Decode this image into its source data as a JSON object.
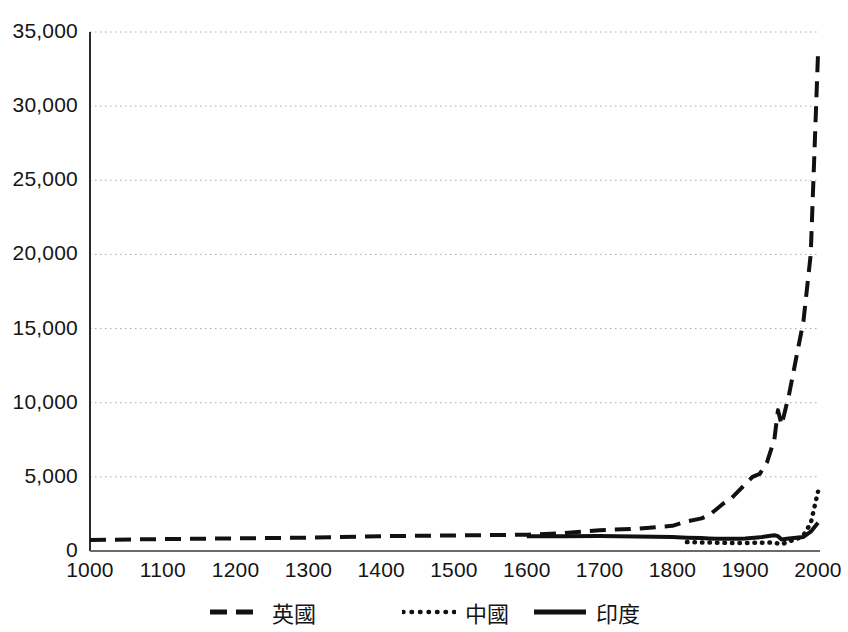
{
  "chart_data": {
    "type": "line",
    "title": "",
    "xlabel": "",
    "ylabel": "",
    "xlim": [
      1000,
      2000
    ],
    "ylim": [
      0,
      35000
    ],
    "grid": "horizontal-dotted",
    "legend_position": "bottom-center",
    "xticks": [
      "1000",
      "1100",
      "1200",
      "1300",
      "1400",
      "1500",
      "1600",
      "1700",
      "1800",
      "1900",
      "2000"
    ],
    "yticks": [
      "0",
      "5,000",
      "10,000",
      "15,000",
      "20,000",
      "25,000",
      "30,000",
      "35,000"
    ],
    "series": [
      {
        "name": "英國",
        "style": "dashed",
        "color": "#111111",
        "x": [
          1000,
          1100,
          1200,
          1300,
          1400,
          1500,
          1600,
          1650,
          1700,
          1750,
          1800,
          1820,
          1840,
          1850,
          1860,
          1870,
          1880,
          1890,
          1900,
          1910,
          1920,
          1930,
          1940,
          1945,
          1950,
          1960,
          1970,
          1980,
          1990,
          2000
        ],
        "values": [
          750,
          800,
          850,
          900,
          1000,
          1050,
          1100,
          1200,
          1400,
          1500,
          1700,
          2000,
          2200,
          2400,
          2800,
          3200,
          3500,
          4000,
          4500,
          5000,
          5200,
          6000,
          7500,
          9500,
          8500,
          10500,
          13000,
          15500,
          20000,
          33500
        ]
      },
      {
        "name": "中國",
        "style": "dotted",
        "color": "#111111",
        "x": [
          1820,
          1840,
          1850,
          1860,
          1870,
          1880,
          1890,
          1900,
          1913,
          1920,
          1930,
          1940,
          1950,
          1960,
          1970,
          1980,
          1990,
          2000
        ],
        "values": [
          600,
          580,
          570,
          560,
          550,
          540,
          540,
          545,
          550,
          560,
          570,
          560,
          450,
          650,
          780,
          1060,
          1870,
          4000
        ]
      },
      {
        "name": "印度",
        "style": "solid",
        "color": "#111111",
        "x": [
          1600,
          1650,
          1700,
          1750,
          1800,
          1820,
          1840,
          1850,
          1860,
          1870,
          1880,
          1890,
          1900,
          1913,
          1920,
          1930,
          1940,
          1945,
          1950,
          1960,
          1970,
          1980,
          1990,
          2000
        ],
        "values": [
          1000,
          1000,
          1010,
          980,
          950,
          900,
          870,
          850,
          830,
          820,
          820,
          830,
          850,
          900,
          920,
          1000,
          1060,
          1000,
          780,
          850,
          900,
          950,
          1300,
          1900
        ]
      }
    ]
  },
  "legend": {
    "entries": [
      {
        "label": "英國",
        "style": "dashed"
      },
      {
        "label": "中國",
        "style": "dotted"
      },
      {
        "label": "印度",
        "style": "solid"
      }
    ]
  }
}
